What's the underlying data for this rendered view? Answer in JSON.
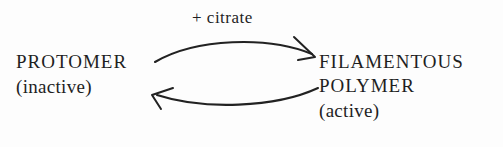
{
  "figure": {
    "type": "reaction-equilibrium-diagram",
    "background_color": "#fdfdfd",
    "stroke_color": "#222222",
    "text_color": "#1f1f1f"
  },
  "left_species": {
    "name": "PROTOMER",
    "state": "(inactive)"
  },
  "right_species": {
    "line1": "FILAMENTOUS",
    "line2": "POLYMER",
    "state": "(active)"
  },
  "forward_arrow": {
    "label": "+ citrate",
    "direction": "left-to-right",
    "curvature": "convex-up",
    "arrowhead": "open-v"
  },
  "reverse_arrow": {
    "label": "",
    "direction": "right-to-left",
    "curvature": "convex-down",
    "arrowhead": "open-v"
  }
}
